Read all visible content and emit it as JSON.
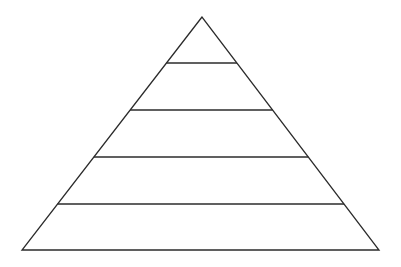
{
  "diagram": {
    "type": "pyramid",
    "levels": 5,
    "labels": [],
    "stroke_color": "#2b2b2b",
    "background": "#ffffff",
    "apex": [
      202,
      17
    ],
    "base_left": [
      22,
      250
    ],
    "base_right": [
      379,
      250
    ],
    "divider_y": [
      63,
      110,
      157,
      204
    ]
  }
}
